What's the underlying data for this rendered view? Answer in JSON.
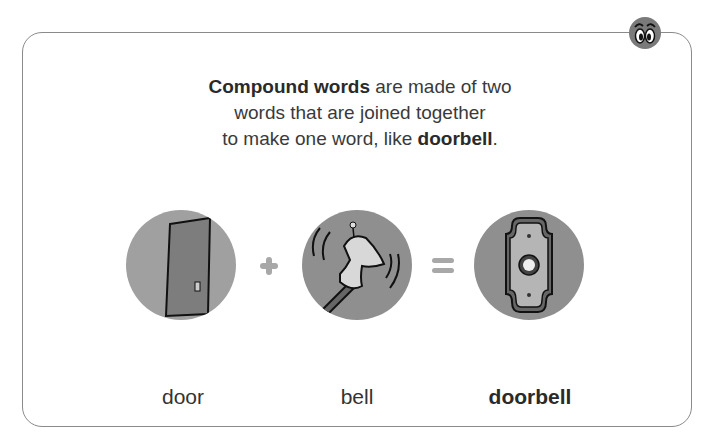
{
  "intro": {
    "bold_start": "Compound words",
    "line1_rest": " are made of two",
    "line2": "words that are joined together",
    "line3_start": "to make one word, like ",
    "bold_end": "doorbell",
    "period": "."
  },
  "equation": {
    "items": [
      {
        "icon": "door-icon",
        "word": "door"
      },
      {
        "icon": "bell-icon",
        "word": "bell"
      },
      {
        "icon": "doorbell-icon",
        "word": "doorbell"
      }
    ],
    "operators": [
      "plus-icon",
      "equals-icon"
    ]
  },
  "colors": {
    "border": "#8a8a8a",
    "circle": "#8f8f8f",
    "operator": "#a8a8a8",
    "text": "#333333"
  }
}
